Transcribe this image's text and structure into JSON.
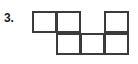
{
  "figure": {
    "problem_number": "3.",
    "type": "polyomino-grid-net",
    "colors": {
      "stroke": "#3b3b3b",
      "fill": "#ffffff",
      "label": "#1a1a1a",
      "background": "#ffffff"
    },
    "grid": {
      "columns": 4,
      "rows": 2,
      "cell_width_px": 25,
      "cell_height_px": 22,
      "filled_cell_count": 6,
      "rows_data": [
        {
          "name": "top-row",
          "cells": [
            {
              "col": 1,
              "filled": true
            },
            {
              "col": 2,
              "filled": true
            },
            {
              "col": 3,
              "filled": false
            },
            {
              "col": 4,
              "filled": true
            }
          ]
        },
        {
          "name": "bottom-row",
          "cells": [
            {
              "col": 1,
              "filled": false
            },
            {
              "col": 2,
              "filled": true
            },
            {
              "col": 3,
              "filled": true
            },
            {
              "col": 4,
              "filled": true
            }
          ]
        }
      ]
    }
  }
}
